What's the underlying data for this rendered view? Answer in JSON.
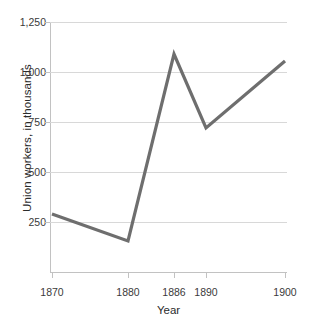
{
  "chart_data": {
    "type": "line",
    "title": "",
    "xlabel": "Year",
    "ylabel": "Union workers, in thousands",
    "categories": [
      "1870",
      "1880",
      "1886",
      "1890",
      "1900"
    ],
    "x": [
      1870,
      1880,
      1886,
      1890,
      1900
    ],
    "values": [
      290,
      155,
      1090,
      720,
      1055
    ],
    "series": [
      {
        "name": "Union workers",
        "values": [
          290,
          155,
          1090,
          720,
          1055
        ]
      }
    ],
    "ylim": [
      0,
      1250
    ],
    "yticks": [
      250,
      500,
      750,
      1000,
      1250
    ],
    "ytick_labels": [
      "250",
      "500",
      "750",
      "1,000",
      "1,250"
    ],
    "xtick_labels": [
      "1870",
      "1880",
      "1886",
      "1890",
      "1900"
    ],
    "grid": true,
    "legend": "none",
    "line_color": "#6e6e6e",
    "grid_color": "#d8d8d8",
    "axis_color": "#c2c2c2",
    "background_color": "#ffffff"
  },
  "axis": {
    "y_title": "Union workers, in thousands",
    "x_title": "Year"
  }
}
